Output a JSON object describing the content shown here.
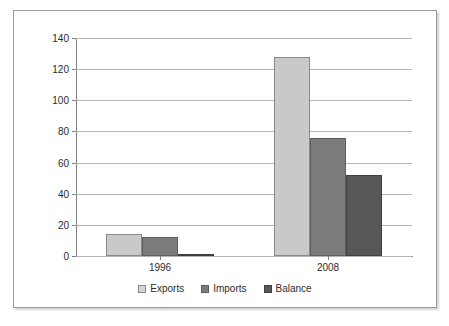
{
  "chart_data": {
    "type": "bar",
    "title": "",
    "subtitle": "",
    "xlabel": "",
    "ylabel": "",
    "categories": [
      "1996",
      "2008"
    ],
    "series": [
      {
        "name": "Exports",
        "values": [
          14,
          128
        ],
        "color": "#c9c9c9"
      },
      {
        "name": "Imports",
        "values": [
          12,
          76
        ],
        "color": "#7b7b7b"
      },
      {
        "name": "Balance",
        "values": [
          1.5,
          52
        ],
        "color": "#575757"
      }
    ],
    "ylim": [
      0,
      140
    ],
    "yticks": [
      0,
      20,
      40,
      60,
      80,
      100,
      120,
      140
    ],
    "ytick_labels": [
      "0",
      "20",
      "40",
      "60",
      "80",
      "100",
      "120",
      "140"
    ],
    "grid": true,
    "grid_axis": "y",
    "legend": true,
    "legend_position": "bottom",
    "legend_entries": [
      "Exports",
      "Imports",
      "Balance"
    ]
  },
  "frame": {
    "border_color": "#9a9a9a",
    "background": "#ffffff"
  }
}
